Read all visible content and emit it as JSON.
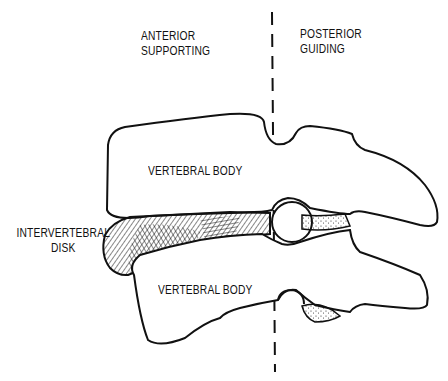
{
  "diagram": {
    "regions": {
      "anterior": {
        "line1": "ANTERIOR",
        "line2": "SUPPORTING"
      },
      "posterior": {
        "line1": "POSTERIOR",
        "line2": "GUIDING"
      }
    },
    "labels": {
      "upper_body": "VERTEBRAL BODY",
      "lower_body": "VERTEBRAL BODY",
      "disk_line1": "INTERVERTEBRAL",
      "disk_line2": "DISK"
    },
    "colors": {
      "line": "#111111",
      "background": "#ffffff"
    }
  }
}
